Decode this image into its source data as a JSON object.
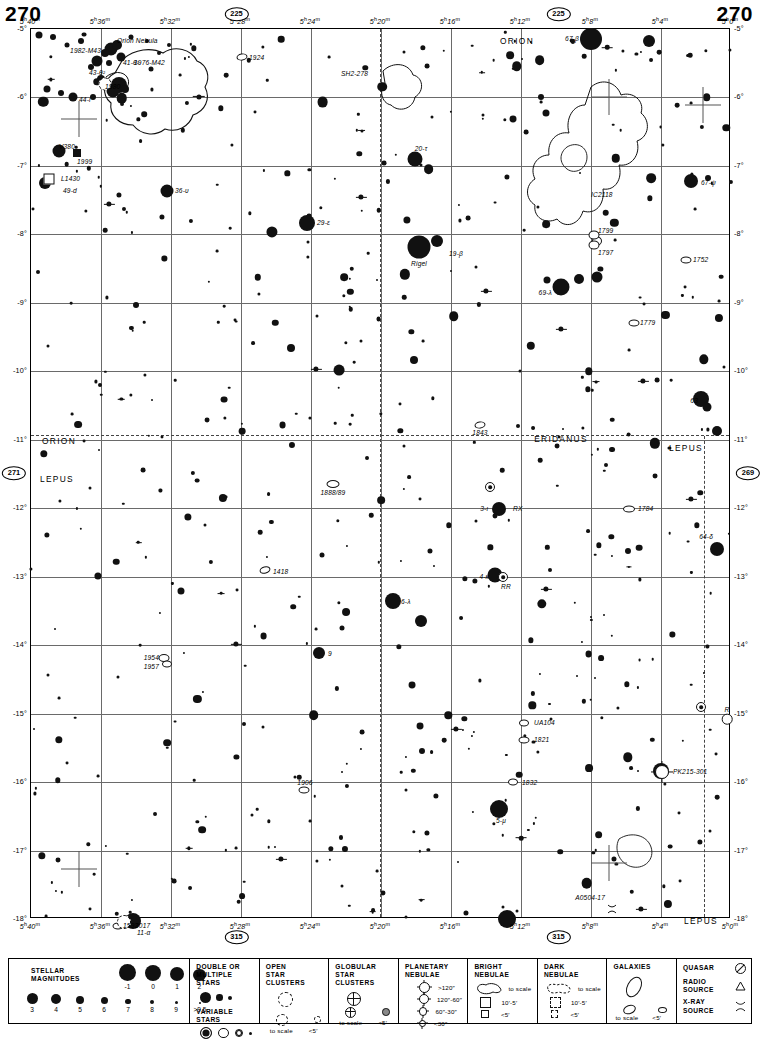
{
  "page": {
    "number_left": "270",
    "number_right": "270"
  },
  "chart": {
    "ra_ticks_top": [
      "5ʰ40ᵐ",
      "5ʰ36ᵐ",
      "5ʰ32ᵐ",
      "5ʰ28ᵐ",
      "5ʰ24ᵐ",
      "5ʰ20ᵐ",
      "5ʰ16ᵐ",
      "5ʰ12ᵐ",
      "5ʰ8ᵐ",
      "5ʰ4ᵐ",
      "5ʰ0ᵐ"
    ],
    "ra_ticks_bottom": [
      "5ʰ40ᵐ",
      "5ʰ36ᵐ",
      "5ʰ32ᵐ",
      "5ʰ28ᵐ",
      "5ʰ24ᵐ",
      "5ʰ20ᵐ",
      "5ʰ16ᵐ",
      "5ʰ12ᵐ",
      "5ʰ8ᵐ",
      "5ʰ4ᵐ",
      "5ʰ0ᵐ"
    ],
    "dec_ticks": [
      "-5°",
      "-6°",
      "-7°",
      "-8°",
      "-9°",
      "-10°",
      "-11°",
      "-12°",
      "-13°",
      "-14°",
      "-15°",
      "-16°",
      "-17°",
      "-18°"
    ],
    "adjacent_charts": [
      {
        "label": "225",
        "pos": "top-left-of-center"
      },
      {
        "label": "225",
        "pos": "top-right-of-center"
      },
      {
        "label": "271",
        "pos": "left"
      },
      {
        "label": "269",
        "pos": "right"
      },
      {
        "label": "315",
        "pos": "bottom-left-of-center"
      },
      {
        "label": "315",
        "pos": "bottom-right-of-center"
      }
    ],
    "constellations": [
      "ORION",
      "ERIDANUS",
      "LEPUS"
    ]
  },
  "objects": [
    {
      "id": "orion-nebula",
      "label": "Orion Nebula",
      "type": "bright-nebula"
    },
    {
      "id": "ngc1982",
      "label": "1982-M43",
      "type": "bright-nebula"
    },
    {
      "id": "ngc1976",
      "label": "1976-M42",
      "type": "bright-nebula"
    },
    {
      "id": "theta1",
      "label": "41-θ¹",
      "type": "multiple-star"
    },
    {
      "id": "theta2",
      "label": "43-θ²",
      "type": "multiple-star"
    },
    {
      "id": "ngc1980",
      "label": "1980",
      "type": "open-cluster"
    },
    {
      "id": "iota",
      "label": "44-ι",
      "type": "star"
    },
    {
      "id": "ngc1924",
      "label": "1924",
      "type": "galaxy"
    },
    {
      "id": "sh2-278",
      "label": "SH2-278",
      "type": "bright-nebula"
    },
    {
      "id": "v380",
      "label": "V380",
      "type": "variable-star"
    },
    {
      "id": "ngc1999",
      "label": "1999",
      "type": "bright-nebula"
    },
    {
      "id": "ldn1430",
      "label": "L1430",
      "type": "dark-nebula"
    },
    {
      "id": "49d",
      "label": "49-d",
      "type": "star"
    },
    {
      "id": "36ups",
      "label": "36-υ",
      "type": "star"
    },
    {
      "id": "29eps",
      "label": "29-ε",
      "type": "star"
    },
    {
      "id": "20tau",
      "label": "20-τ",
      "type": "star"
    },
    {
      "id": "19beta",
      "label": "19-β",
      "type": "star"
    },
    {
      "id": "rigel",
      "label": "Rigel",
      "type": "star"
    },
    {
      "id": "69lam",
      "label": "69-λ",
      "type": "star"
    },
    {
      "id": "67beta",
      "label": "67-β",
      "type": "star"
    },
    {
      "id": "67psi",
      "label": "67-ψ",
      "type": "star"
    },
    {
      "id": "ic2118",
      "label": "IC2118",
      "type": "bright-nebula"
    },
    {
      "id": "ngc1799",
      "label": "1799",
      "type": "galaxy"
    },
    {
      "id": "ngc1797",
      "label": "1797",
      "type": "galaxy"
    },
    {
      "id": "ngc1752",
      "label": "1752",
      "type": "galaxy"
    },
    {
      "id": "ngc1779",
      "label": "1779",
      "type": "galaxy"
    },
    {
      "id": "ngc1843",
      "label": "1843",
      "type": "galaxy"
    },
    {
      "id": "ngc1888",
      "label": "1888/89",
      "type": "galaxy"
    },
    {
      "id": "ngc1784",
      "label": "1784",
      "type": "galaxy"
    },
    {
      "id": "ngc63",
      "label": "63",
      "type": "star"
    },
    {
      "id": "star34",
      "label": "3-ι",
      "type": "star"
    },
    {
      "id": "rx",
      "label": "RX",
      "type": "variable-star"
    },
    {
      "id": "star64",
      "label": "64-δ",
      "type": "star"
    },
    {
      "id": "ngc1418",
      "label": "1418",
      "type": "galaxy"
    },
    {
      "id": "star4kap",
      "label": "4-κ",
      "type": "star"
    },
    {
      "id": "rr",
      "label": "RR",
      "type": "variable-star"
    },
    {
      "id": "star6lam",
      "label": "6-λ",
      "type": "star"
    },
    {
      "id": "star9beta",
      "label": "9",
      "type": "star"
    },
    {
      "id": "ngc1954",
      "label": "1954",
      "type": "galaxy"
    },
    {
      "id": "ngc1957",
      "label": "1957",
      "type": "galaxy"
    },
    {
      "id": "ua104",
      "label": "UA104",
      "type": "galaxy"
    },
    {
      "id": "ngc1821",
      "label": "1821",
      "type": "galaxy"
    },
    {
      "id": "r-lep",
      "label": "R",
      "type": "variable-star"
    },
    {
      "id": "pk215",
      "label": "PK215-301",
      "type": "planetary-nebula"
    },
    {
      "id": "ngc1906",
      "label": "1906",
      "type": "galaxy"
    },
    {
      "id": "ngc1832",
      "label": "1832",
      "type": "galaxy"
    },
    {
      "id": "star5mu",
      "label": "5-μ",
      "type": "star"
    },
    {
      "id": "a0504",
      "label": "A0504-17",
      "type": "x-ray-source"
    },
    {
      "id": "ngc2017",
      "label": "2017",
      "type": "open-cluster"
    },
    {
      "id": "ngc1593",
      "label": "1593",
      "type": "galaxy"
    },
    {
      "id": "star11alp",
      "label": "11-α",
      "type": "star"
    }
  ],
  "legend": {
    "stellar_magnitudes": {
      "title_line1": "STELLAR",
      "title_line2": "MAGNITUDES",
      "top_row": [
        "-1",
        "0",
        "1",
        "2"
      ],
      "bottom_row": [
        "3",
        "4",
        "5",
        "6",
        "7",
        "8",
        "9",
        ">9.5"
      ]
    },
    "double_stars": {
      "title_line1": "DOUBLE OR",
      "title_line2": "MULTIPLE STARS"
    },
    "variable_stars": {
      "title": "VARIABLE STARS"
    },
    "open_clusters": {
      "title_line1": "OPEN",
      "title_line2": "STAR CLUSTERS",
      "scale": "to scale",
      "small": "<5′"
    },
    "globular_clusters": {
      "title_line1": "GLOBULAR",
      "title_line2": "STAR CLUSTERS",
      "scale": "to scale",
      "small": "<5′"
    },
    "planetary_nebulae": {
      "title_line1": "PLANETARY",
      "title_line2": "NEBULAE",
      "sizes": [
        ">120″",
        "120″-60″",
        "60″-30″",
        "<30″"
      ]
    },
    "bright_nebulae": {
      "title_line1": "BRIGHT",
      "title_line2": "NEBULAE",
      "scale": "to scale",
      "mid": "10′-5′",
      "small": "<5′"
    },
    "dark_nebulae": {
      "title_line1": "DARK",
      "title_line2": "NEBULAE",
      "scale": "to scale",
      "mid": "10′-5′",
      "small": "<5′"
    },
    "galaxies": {
      "title": "GALAXIES",
      "scale": "to scale",
      "small": "<5′"
    },
    "sources": {
      "quasar": "QUASAR",
      "radio_line1": "RADIO",
      "radio_line2": "SOURCE",
      "xray_line1": "X-RAY",
      "xray_line2": "SOURCE"
    }
  }
}
